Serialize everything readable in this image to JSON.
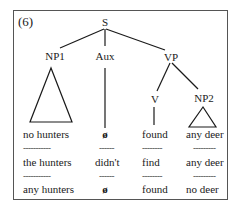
{
  "example_number": "(6)",
  "tree": {
    "root": "S",
    "np1": "NP1",
    "aux": "Aux",
    "vp": "VP",
    "v": "V",
    "np2": "NP2"
  },
  "rows": [
    {
      "np1": "no hunters",
      "aux": "ø",
      "v": "found",
      "np2": "any deer"
    },
    {
      "np1": "the hunters",
      "aux": "didn't",
      "v": "find",
      "np2": "any deer"
    },
    {
      "np1": "any hunters",
      "aux": "ø",
      "v": "found",
      "np2": "no deer"
    }
  ],
  "separators": {
    "np1": "-----------",
    "aux": "------",
    "v": "--------",
    "np2": "---------"
  },
  "colors": {
    "line": "#1a1a1a",
    "border": "#555555",
    "background": "#ffffff"
  }
}
